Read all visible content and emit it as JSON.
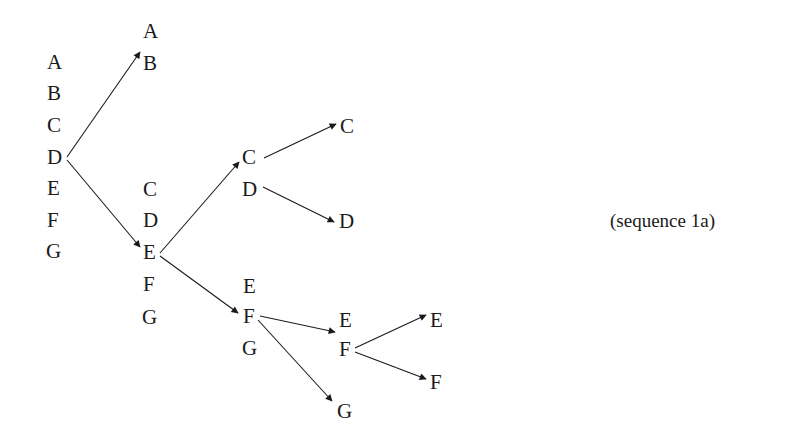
{
  "caption": "(sequence 1a)",
  "colors": {
    "ink": "#1a1a1a",
    "background": "#ffffff"
  },
  "nodes": [
    {
      "id": "c1-A",
      "label": "A",
      "x": 47,
      "y": 62
    },
    {
      "id": "c1-B",
      "label": "B",
      "x": 47,
      "y": 93
    },
    {
      "id": "c1-C",
      "label": "C",
      "x": 47,
      "y": 125
    },
    {
      "id": "c1-D",
      "label": "D",
      "x": 47,
      "y": 157
    },
    {
      "id": "c1-E",
      "label": "E",
      "x": 47,
      "y": 188
    },
    {
      "id": "c1-F",
      "label": "F",
      "x": 47,
      "y": 220
    },
    {
      "id": "c1-G",
      "label": "G",
      "x": 46,
      "y": 251
    },
    {
      "id": "c2a-A",
      "label": "A",
      "x": 143,
      "y": 31
    },
    {
      "id": "c2a-B",
      "label": "B",
      "x": 143,
      "y": 63
    },
    {
      "id": "c2b-C",
      "label": "C",
      "x": 143,
      "y": 189
    },
    {
      "id": "c2b-D",
      "label": "D",
      "x": 143,
      "y": 220
    },
    {
      "id": "c2b-E",
      "label": "E",
      "x": 143,
      "y": 252
    },
    {
      "id": "c2b-F",
      "label": "F",
      "x": 143,
      "y": 284
    },
    {
      "id": "c2b-G",
      "label": "G",
      "x": 142,
      "y": 317
    },
    {
      "id": "c3a-C",
      "label": "C",
      "x": 242,
      "y": 157
    },
    {
      "id": "c3a-D",
      "label": "D",
      "x": 242,
      "y": 189
    },
    {
      "id": "c3b-E",
      "label": "E",
      "x": 243,
      "y": 286
    },
    {
      "id": "c3b-F",
      "label": "F",
      "x": 243,
      "y": 316
    },
    {
      "id": "c3b-G",
      "label": "G",
      "x": 242,
      "y": 348
    },
    {
      "id": "c4a-C",
      "label": "C",
      "x": 340,
      "y": 126
    },
    {
      "id": "c4a-D",
      "label": "D",
      "x": 339,
      "y": 221
    },
    {
      "id": "c4b-E",
      "label": "E",
      "x": 339,
      "y": 320
    },
    {
      "id": "c4b-F",
      "label": "F",
      "x": 339,
      "y": 349
    },
    {
      "id": "c4b-G",
      "label": "G",
      "x": 337,
      "y": 411
    },
    {
      "id": "c5-E",
      "label": "E",
      "x": 430,
      "y": 320
    },
    {
      "id": "c5-F",
      "label": "F",
      "x": 430,
      "y": 382
    }
  ],
  "edges": [
    {
      "from": "c1-D",
      "to": "c2a-B",
      "x1": 67,
      "y1": 157,
      "x2": 140,
      "y2": 52
    },
    {
      "from": "c1-D",
      "to": "c2b-E",
      "x1": 67,
      "y1": 160,
      "x2": 140,
      "y2": 247
    },
    {
      "from": "c2b-E",
      "to": "c3a-C",
      "x1": 160,
      "y1": 253,
      "x2": 239,
      "y2": 162
    },
    {
      "from": "c2b-E",
      "to": "c3b-F",
      "x1": 160,
      "y1": 256,
      "x2": 238,
      "y2": 313
    },
    {
      "from": "c3a-C",
      "to": "c4a-C",
      "x1": 264,
      "y1": 158,
      "x2": 336,
      "y2": 124
    },
    {
      "from": "c3a-D",
      "to": "c4a-D",
      "x1": 263,
      "y1": 187,
      "x2": 334,
      "y2": 222
    },
    {
      "from": "c3b-F",
      "to": "c4b-EF",
      "x1": 260,
      "y1": 316,
      "x2": 335,
      "y2": 332
    },
    {
      "from": "c3b-F",
      "to": "c4b-G",
      "x1": 258,
      "y1": 320,
      "x2": 332,
      "y2": 401
    },
    {
      "from": "c4b-F",
      "to": "c5-E",
      "x1": 355,
      "y1": 348,
      "x2": 426,
      "y2": 315
    },
    {
      "from": "c4b-F",
      "to": "c5-F",
      "x1": 355,
      "y1": 352,
      "x2": 426,
      "y2": 379
    }
  ]
}
